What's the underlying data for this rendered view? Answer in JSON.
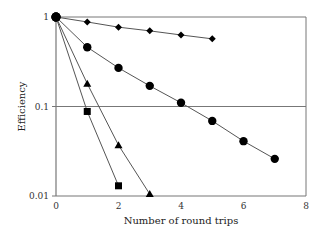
{
  "chart_data": {
    "type": "line",
    "title": "",
    "xlabel": "Number of round trips",
    "ylabel": "Efficiency",
    "xlim": [
      0,
      8
    ],
    "ylim": [
      0.01,
      1
    ],
    "yscale": "log",
    "x_ticks": [
      "0",
      "2",
      "4",
      "6",
      "8"
    ],
    "y_ticks": [
      "0.01",
      "0.1",
      "1"
    ],
    "grid": "horizontal lines at 0.1 and 1",
    "legend": "none",
    "series": [
      {
        "name": "diamond",
        "marker": "diamond",
        "x": [
          0,
          1,
          2,
          3,
          4,
          5
        ],
        "values": [
          1,
          0.88,
          0.77,
          0.7,
          0.63,
          0.57
        ]
      },
      {
        "name": "circle",
        "marker": "circle",
        "x": [
          0,
          1,
          2,
          3,
          4,
          5,
          6,
          7
        ],
        "values": [
          1,
          0.46,
          0.27,
          0.17,
          0.11,
          0.069,
          0.041,
          0.026
        ]
      },
      {
        "name": "triangle",
        "marker": "triangle",
        "x": [
          0,
          1,
          2,
          3
        ],
        "values": [
          1,
          0.18,
          0.037,
          0.0105
        ]
      },
      {
        "name": "square",
        "marker": "square",
        "x": [
          0,
          1,
          2
        ],
        "values": [
          1,
          0.088,
          0.013
        ]
      }
    ]
  }
}
